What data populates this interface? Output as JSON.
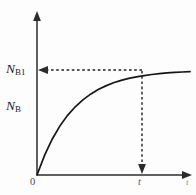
{
  "figure": {
    "background_color": "#fdfdfd",
    "ink_color": "#1a1a1a"
  },
  "labels": {
    "y_saturation": "N",
    "y_saturation_sub": "B1",
    "y_axis": "N",
    "y_axis_sub": "B",
    "origin": "0",
    "x_point": "t",
    "x_axis": "t"
  },
  "chart_data": {
    "type": "line",
    "title": "",
    "xlabel": "t",
    "ylabel": "N_B",
    "grid": false,
    "legend": null,
    "annotations": [
      {
        "name": "saturation-level",
        "label": "N_B1",
        "type": "horizontal-dashed-arrow",
        "y": 1.0,
        "direction": "left",
        "from_x": 0.78,
        "to_x": 0.0
      },
      {
        "name": "time-marker",
        "label": "t",
        "type": "vertical-dashed-arrow",
        "x": 0.78,
        "direction": "down",
        "from_y": 1.0,
        "to_y": 0.0
      }
    ],
    "axis_arrows": {
      "x": "right",
      "y": "up"
    },
    "xlim": [
      0,
      1
    ],
    "ylim": [
      0,
      1.08
    ],
    "curve_equation": "N_B(t) = N_B1 * (1 - exp(-k*t))",
    "curve_decay_constant": 4.2,
    "x": [
      0.0,
      0.05,
      0.1,
      0.15,
      0.2,
      0.25,
      0.3,
      0.35,
      0.4,
      0.45,
      0.5,
      0.55,
      0.6,
      0.65,
      0.7,
      0.75,
      0.8,
      0.85,
      0.9,
      0.95,
      1.0
    ],
    "values": [
      0.0,
      0.189,
      0.343,
      0.468,
      0.568,
      0.65,
      0.716,
      0.77,
      0.814,
      0.849,
      0.878,
      0.901,
      0.92,
      0.935,
      0.947,
      0.957,
      0.965,
      0.972,
      0.977,
      0.981,
      0.985
    ],
    "marked_point": {
      "x": 0.78,
      "y": 0.962,
      "x_label": "t",
      "y_label": "N_B1"
    }
  }
}
